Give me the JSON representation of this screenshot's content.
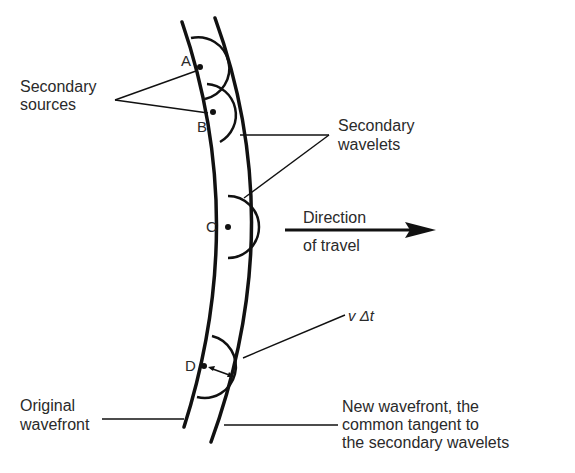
{
  "diagram": {
    "labels": {
      "secondary_sources": [
        "Secondary",
        "sources"
      ],
      "secondary_wavelets": [
        "Secondary",
        "wavelets"
      ],
      "direction": [
        "Direction",
        "of travel"
      ],
      "v_delta_t": "v Δt",
      "original_wavefront": [
        "Original",
        "wavefront"
      ],
      "new_wavefront": [
        "New wavefront, the",
        "common tangent to",
        "the secondary wavelets"
      ]
    },
    "points": [
      {
        "id": "A",
        "label": "A"
      },
      {
        "id": "B",
        "label": "B"
      },
      {
        "id": "C",
        "label": "C"
      },
      {
        "id": "D",
        "label": "D"
      }
    ],
    "colors": {
      "line": "#111111",
      "text": "#2a2a2a",
      "background": "#ffffff"
    }
  }
}
